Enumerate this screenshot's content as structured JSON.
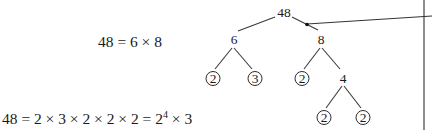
{
  "equations": {
    "top": "48 = 6 × 8",
    "bottom_main": "48 = 2 × 3 × 2 × 2 × 2 = 2",
    "bottom_exponent": "4",
    "bottom_tail": " × 3"
  },
  "factor_tree": {
    "root": "48",
    "level1": [
      "6",
      "8"
    ],
    "level2": [
      {
        "label": "2",
        "prime": true
      },
      {
        "label": "3",
        "prime": true
      },
      {
        "label": "2",
        "prime": true
      },
      {
        "label": "4",
        "prime": false
      }
    ],
    "level3": [
      {
        "label": "2",
        "prime": true
      },
      {
        "label": "2",
        "prime": true
      }
    ]
  },
  "colors": {
    "text": "#1a1a1a",
    "divider": "#8c8c8c"
  }
}
